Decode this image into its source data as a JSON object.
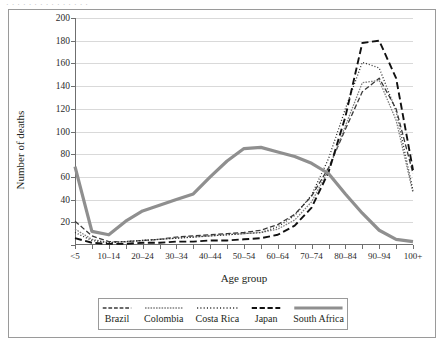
{
  "figure": {
    "caption_sliver": "· · ·   · ·   ·   · ·   · · ·   · ·   ·   ·",
    "frame_color": "#9a9a9a"
  },
  "chart_data": {
    "type": "line",
    "title": "",
    "subtitle": "",
    "xlabel": "Age group",
    "ylabel": "Number of deaths",
    "ylim": [
      0,
      200
    ],
    "ytick_step": 20,
    "yticks": [
      0,
      20,
      40,
      60,
      80,
      100,
      120,
      140,
      160,
      180,
      200
    ],
    "grid": "horizontal",
    "legend_position": "bottom",
    "categories": [
      "<5",
      "5–9",
      "10–14",
      "15–19",
      "20–24",
      "25–29",
      "30–34",
      "35–39",
      "40–44",
      "45–49",
      "50–54",
      "55–59",
      "60–64",
      "65–69",
      "70–74",
      "75–79",
      "80–84",
      "85–89",
      "90–94",
      "95–99",
      "100+"
    ],
    "xtick_labels_shown": [
      "<5",
      "10–14",
      "20–24",
      "30–34",
      "40–44",
      "50–54",
      "60–64",
      "70–74",
      "80–84",
      "90–94",
      "100+"
    ],
    "series": [
      {
        "name": "Brazil",
        "style": "dashed",
        "color": "#3a3a3a",
        "width": 1.3,
        "dasharray": "5,2.5",
        "values": [
          21,
          8,
          3,
          3,
          4,
          5,
          7,
          8,
          9,
          10,
          11,
          13,
          18,
          27,
          43,
          68,
          102,
          135,
          147,
          120,
          63
        ]
      },
      {
        "name": "Colombia",
        "style": "dash-dot-fine",
        "color": "#808080",
        "width": 1.3,
        "dasharray": "1.6,1.2",
        "values": [
          14,
          5,
          2,
          3,
          4,
          5,
          6,
          7,
          8,
          9,
          10,
          11,
          14,
          22,
          38,
          66,
          105,
          143,
          145,
          110,
          46
        ]
      },
      {
        "name": "Costa Rica",
        "style": "dotted",
        "color": "#2b2b2b",
        "width": 1.3,
        "dasharray": "1,2",
        "values": [
          11,
          4,
          2,
          3,
          4,
          5,
          6,
          7,
          8,
          9,
          10,
          11,
          16,
          26,
          44,
          76,
          120,
          161,
          156,
          118,
          48
        ]
      },
      {
        "name": "Japan",
        "style": "dashed-bold",
        "color": "#111111",
        "width": 1.9,
        "dasharray": "7,3.5",
        "values": [
          6,
          2,
          1,
          1,
          2,
          2,
          3,
          3,
          4,
          4,
          5,
          6,
          9,
          17,
          33,
          64,
          113,
          178,
          180,
          147,
          66
        ]
      },
      {
        "name": "South Africa",
        "style": "solid-thick",
        "color": "#8f8f8f",
        "width": 3.2,
        "dasharray": "",
        "values": [
          69,
          12,
          9,
          21,
          30,
          35,
          40,
          45,
          60,
          74,
          85,
          86,
          82,
          78,
          72,
          63,
          45,
          28,
          13,
          5,
          3
        ]
      }
    ]
  }
}
